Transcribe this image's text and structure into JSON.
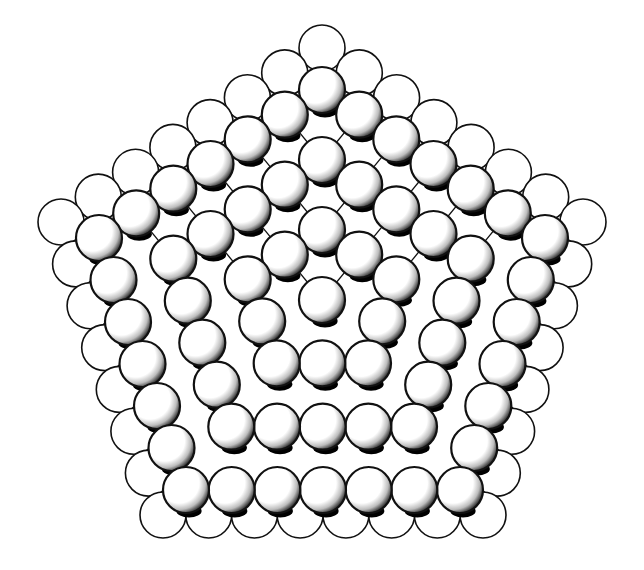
{
  "figure": {
    "width": 644,
    "height": 570,
    "background": "#ffffff",
    "stroke_color": "#111111",
    "shade_color": "#000000",
    "sphere_radius": 23,
    "outer_layer": {
      "shape": "pentagon",
      "spheres_per_edge": 8,
      "corners": [
        [
          322,
          48
        ],
        [
          583,
          222
        ],
        [
          483,
          515
        ],
        [
          163,
          515
        ],
        [
          61,
          222
        ]
      ]
    },
    "inner_layer": {
      "shape": "pentagon",
      "spheres_per_edge": 7,
      "shaded": true,
      "center": [
        322,
        300
      ],
      "corners": [
        [
          322,
          90
        ],
        [
          545,
          238
        ],
        [
          460,
          490
        ],
        [
          186,
          490
        ],
        [
          99,
          238
        ]
      ]
    }
  }
}
